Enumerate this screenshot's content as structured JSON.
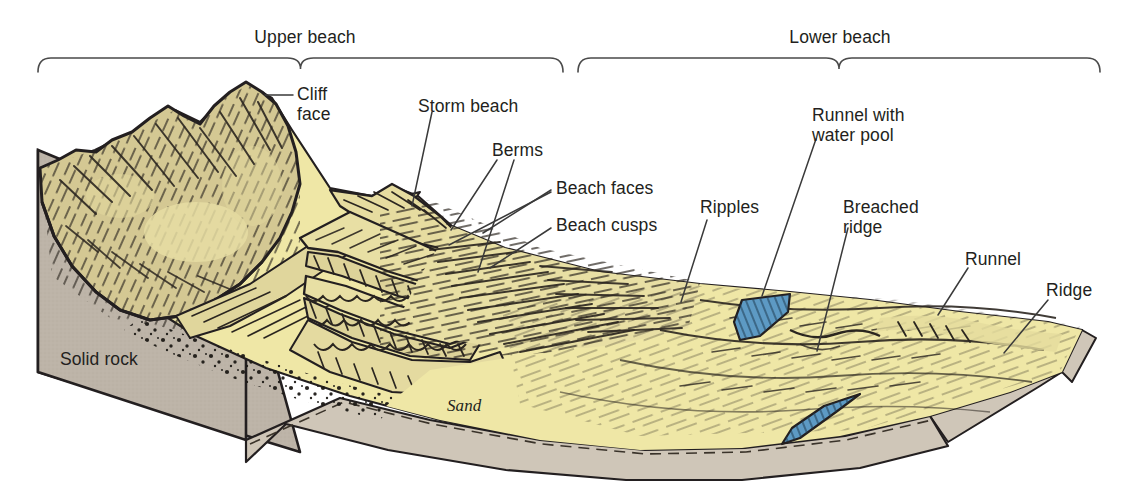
{
  "figure": {
    "type": "geomorphology-block-diagram",
    "background_color": "#ffffff"
  },
  "palette": {
    "sand_light": "#efe7a6",
    "sand_mid": "#e6dca0",
    "cliff_khaki": "#d4c893",
    "cliff_shadow": "#c8bb86",
    "rock_grey": "#bdb4a8",
    "rock_side": "#cfc6b8",
    "water_blue": "#5d9ac4",
    "ink": "#231f20",
    "hatch": "#2b2620",
    "leader": "#3a3a3a"
  },
  "brackets": [
    {
      "id": "upper-beach",
      "label": "Upper beach",
      "label_x": 305,
      "label_y": 27,
      "x1": 38,
      "x2": 563,
      "y": 58
    },
    {
      "id": "lower-beach",
      "label": "Lower beach",
      "label_x": 840,
      "label_y": 27,
      "x1": 578,
      "x2": 1100,
      "y": 58
    }
  ],
  "labels": [
    {
      "id": "cliff-face",
      "text": "Cliff\nface",
      "x": 297,
      "y": 84,
      "align": "left"
    },
    {
      "id": "storm-beach",
      "text": "Storm beach",
      "x": 418,
      "y": 96,
      "align": "left"
    },
    {
      "id": "berms",
      "text": "Berms",
      "x": 492,
      "y": 140,
      "align": "left"
    },
    {
      "id": "beach-faces",
      "text": "Beach faces",
      "x": 556,
      "y": 178,
      "align": "left"
    },
    {
      "id": "beach-cusps",
      "text": "Beach cusps",
      "x": 556,
      "y": 215,
      "align": "left"
    },
    {
      "id": "ripples",
      "text": "Ripples",
      "x": 700,
      "y": 197,
      "align": "left"
    },
    {
      "id": "runnel-water-pool",
      "text": "Runnel with\nwater pool",
      "x": 812,
      "y": 105,
      "align": "left"
    },
    {
      "id": "breached-ridge",
      "text": "Breached\nridge",
      "x": 843,
      "y": 197,
      "align": "left"
    },
    {
      "id": "runnel",
      "text": "Runnel",
      "x": 965,
      "y": 249,
      "align": "left"
    },
    {
      "id": "ridge",
      "text": "Ridge",
      "x": 1046,
      "y": 280,
      "align": "left"
    },
    {
      "id": "solid-rock",
      "text": "Solid rock",
      "x": 60,
      "y": 349,
      "align": "left"
    },
    {
      "id": "sand",
      "text": "Sand",
      "x": 447,
      "y": 396,
      "align": "left",
      "italic": true
    }
  ],
  "leaders": [
    {
      "id": "cliff-face-leader",
      "points": "265,95 293,95"
    },
    {
      "id": "storm-beach-leader",
      "points": "432,112 412,206"
    },
    {
      "id": "berms-leader-a",
      "points": "497,160 451,230"
    },
    {
      "id": "berms-leader-b",
      "points": "514,160 478,272"
    },
    {
      "id": "beach-faces-leader-a",
      "points": "551,190 483,233"
    },
    {
      "id": "beach-faces-leader-b",
      "points": "551,192 449,245"
    },
    {
      "id": "beach-cusps-leader",
      "points": "551,228 490,268"
    },
    {
      "id": "ripples-leader",
      "points": "707,220 681,302"
    },
    {
      "id": "runnel-pool-leader",
      "points": "816,139 762,296"
    },
    {
      "id": "breached-ridge-leader",
      "points": "848,228 817,351"
    },
    {
      "id": "runnel-leader",
      "points": "968,268 938,315"
    },
    {
      "id": "ridge-leader",
      "points": "1048,300 1004,353"
    }
  ],
  "features": [
    {
      "id": "cliff",
      "name": "Cliff face",
      "note": "hatched khaki headland, upper-left"
    },
    {
      "id": "solid-rock",
      "name": "Solid rock",
      "note": "grey basement block, left side face"
    },
    {
      "id": "storm-beach",
      "name": "Storm beach",
      "note": "crest behind berms"
    },
    {
      "id": "berms",
      "name": "Berms",
      "note": "two stepped terraces"
    },
    {
      "id": "beach-faces",
      "name": "Beach faces",
      "note": "sloping fronts of berms"
    },
    {
      "id": "beach-cusps",
      "name": "Beach cusps",
      "note": "scalloped crescent edge"
    },
    {
      "id": "ripples",
      "name": "Ripples",
      "note": "diagonal hatch over lower beach"
    },
    {
      "id": "runnel-pool",
      "name": "Runnel with water pool",
      "note": "blue pool in upper runnel"
    },
    {
      "id": "breached-ridge",
      "name": "Breached ridge",
      "note": "gap cut through ridge"
    },
    {
      "id": "runnel",
      "name": "Runnel",
      "note": "trough right side"
    },
    {
      "id": "ridge",
      "name": "Ridge",
      "note": "sand bar right side"
    },
    {
      "id": "sand",
      "name": "Sand",
      "note": "italic label on dashed basal contact"
    }
  ]
}
